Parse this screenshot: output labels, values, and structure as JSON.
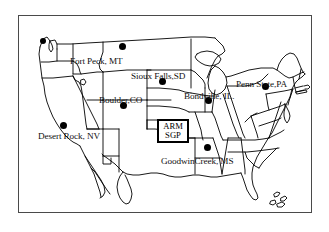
{
  "figure": {
    "type": "map",
    "region": "Continental United States",
    "background_color": "#ffffff",
    "frame_color": "#4a4a4a",
    "outline_color": "#000000",
    "marker_color": "#000000"
  },
  "frame": {
    "x": 18,
    "y": 15,
    "width": 294,
    "height": 198
  },
  "sites": [
    {
      "label": "Fort Peck, MT",
      "label_x": 69,
      "label_y": 56,
      "dot_x": 119,
      "dot_y": 45,
      "has_dot": true
    },
    {
      "label": "Sioux Falls,SD",
      "label_x": 130,
      "label_y": 71,
      "dot_x": 159,
      "dot_y": 80,
      "has_dot": true
    },
    {
      "label": "Penn State,PA",
      "label_x": 235,
      "label_y": 79,
      "dot_x": 262,
      "dot_y": 85,
      "has_dot": true
    },
    {
      "label": "Boulder,CO",
      "label_x": 98,
      "label_y": 95,
      "dot_x": 120,
      "dot_y": 104,
      "has_dot": true
    },
    {
      "label": "Bondville, IL.",
      "label_x": 183,
      "label_y": 91,
      "dot_x": 205,
      "dot_y": 99,
      "has_dot": true
    },
    {
      "label": "Desert Rock, NV",
      "label_x": 37,
      "label_y": 131,
      "dot_x": 60,
      "dot_y": 124,
      "has_dot": true
    },
    {
      "label": "GoodwinCreek, MS",
      "label_x": 160,
      "label_y": 156,
      "dot_x": 204,
      "dot_y": 146,
      "has_dot": true
    },
    {
      "label": "",
      "label_x": 0,
      "label_y": 0,
      "dot_x": 40,
      "dot_y": 40,
      "has_dot": true
    }
  ],
  "boxed_site": {
    "line1": "ARM",
    "line2": "SGP",
    "x": 156,
    "y": 118,
    "width": 32,
    "height": 24
  }
}
